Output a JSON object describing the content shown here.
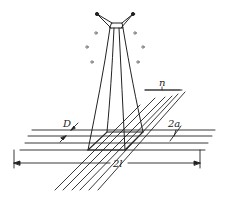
{
  "figure": {
    "type": "technical-diagram",
    "labels": {
      "n": "n",
      "D": "D",
      "two_a": "2a",
      "two_l": "2l"
    },
    "colors": {
      "stroke": "#222222",
      "background": "#ffffff",
      "dots": "#555555"
    }
  }
}
